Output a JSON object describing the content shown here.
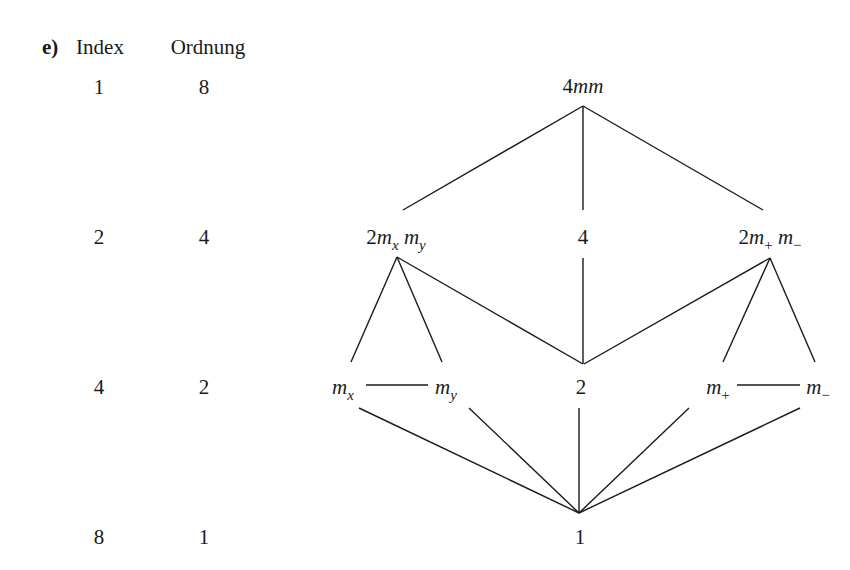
{
  "part_label": "e)",
  "columns": {
    "index_header": "Index",
    "order_header": "Ordnung"
  },
  "rows": [
    {
      "index": "1",
      "order": "8"
    },
    {
      "index": "2",
      "order": "4"
    },
    {
      "index": "4",
      "order": "2"
    },
    {
      "index": "8",
      "order": "1"
    }
  ],
  "nodes": {
    "top": {
      "coef": "4",
      "rest": "mm"
    },
    "l2_left": {
      "coef": "2",
      "m1": "m",
      "s1": "x",
      "m2": "m",
      "s2": "y"
    },
    "l2_mid": {
      "label": "4"
    },
    "l2_right": {
      "coef": "2",
      "m1": "m",
      "s1": "+",
      "m2": "m",
      "s2": "−"
    },
    "l3_mx": {
      "m": "m",
      "s": "x"
    },
    "l3_my": {
      "m": "m",
      "s": "y"
    },
    "l3_mid": {
      "label": "2"
    },
    "l3_mplus": {
      "m": "m",
      "s": "+"
    },
    "l3_mminus": {
      "m": "m",
      "s": "−"
    },
    "bottom": {
      "label": "1"
    }
  },
  "edges": [
    [
      "4mm",
      "2mxmy"
    ],
    [
      "4mm",
      "4"
    ],
    [
      "4mm",
      "2m+m-"
    ],
    [
      "2mxmy",
      "mx"
    ],
    [
      "2mxmy",
      "my"
    ],
    [
      "2mxmy",
      "2"
    ],
    [
      "4",
      "2"
    ],
    [
      "2m+m-",
      "2"
    ],
    [
      "2m+m-",
      "m+"
    ],
    [
      "2m+m-",
      "m-"
    ],
    [
      "mx",
      "my"
    ],
    [
      "m+",
      "m-"
    ],
    [
      "mx",
      "1"
    ],
    [
      "my",
      "1"
    ],
    [
      "2",
      "1"
    ],
    [
      "m+",
      "1"
    ],
    [
      "m-",
      "1"
    ]
  ]
}
